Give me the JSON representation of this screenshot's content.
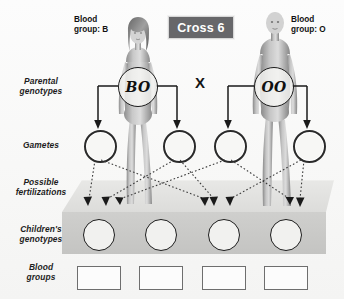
{
  "diagram": {
    "title": "Cross 6",
    "type": "genetics-monohybrid-cross"
  },
  "parents": {
    "mother": {
      "blood_group_label_line1": "Blood",
      "blood_group_label_line2": "group: B",
      "blood_group": "B",
      "genotype": "BO",
      "sex": "female"
    },
    "father": {
      "blood_group_label_line1": "Blood",
      "blood_group_label_line2": "group: O",
      "blood_group": "O",
      "genotype": "OO",
      "sex": "male"
    },
    "cross_symbol": "X"
  },
  "row_labels": {
    "parental_genotypes_line1": "Parental",
    "parental_genotypes_line2": "genotypes",
    "gametes": "Gametes",
    "possible_fertilizations_line1": "Possible",
    "possible_fertilizations_line2": "fertilizations",
    "childrens_genotypes_line1": "Children's",
    "childrens_genotypes_line2": "genotypes",
    "blood_groups_line1": "Blood",
    "blood_groups_line2": "groups"
  },
  "gametes": [
    {
      "index": 1,
      "parent": "mother",
      "value": ""
    },
    {
      "index": 2,
      "parent": "mother",
      "value": ""
    },
    {
      "index": 3,
      "parent": "father",
      "value": ""
    },
    {
      "index": 4,
      "parent": "father",
      "value": ""
    }
  ],
  "children_genotypes": [
    {
      "index": 1,
      "value": ""
    },
    {
      "index": 2,
      "value": ""
    },
    {
      "index": 3,
      "value": ""
    },
    {
      "index": 4,
      "value": ""
    }
  ],
  "children_blood_groups": [
    {
      "index": 1,
      "value": ""
    },
    {
      "index": 2,
      "value": ""
    },
    {
      "index": 3,
      "value": ""
    },
    {
      "index": 4,
      "value": ""
    }
  ],
  "colors": {
    "title_badge_bg": "#67676a",
    "title_badge_text": "#ffffff",
    "line": "#1a1a1a",
    "slab_top": "#e2e2e0",
    "slab_front": "#c9c9c7",
    "background": "#fbfbfa",
    "box_border": "#6e6e6e"
  }
}
